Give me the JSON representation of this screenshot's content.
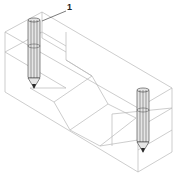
{
  "figure": {
    "type": "isometric-wireframe",
    "callouts": [
      {
        "id": "callout-1",
        "text": "1",
        "target": "left-probe"
      }
    ],
    "components": {
      "block": {
        "name": "block",
        "groove": "V-groove"
      },
      "probes": [
        {
          "name": "left-probe",
          "shape": "cylinder with conical tip"
        },
        {
          "name": "right-probe",
          "shape": "cylinder with conical tip"
        }
      ]
    },
    "colors": {
      "edge": "#b8b8b8",
      "probe_outline": "#3a3a3a",
      "probe_fill": "#e6e6e6",
      "label": "#222222"
    }
  }
}
